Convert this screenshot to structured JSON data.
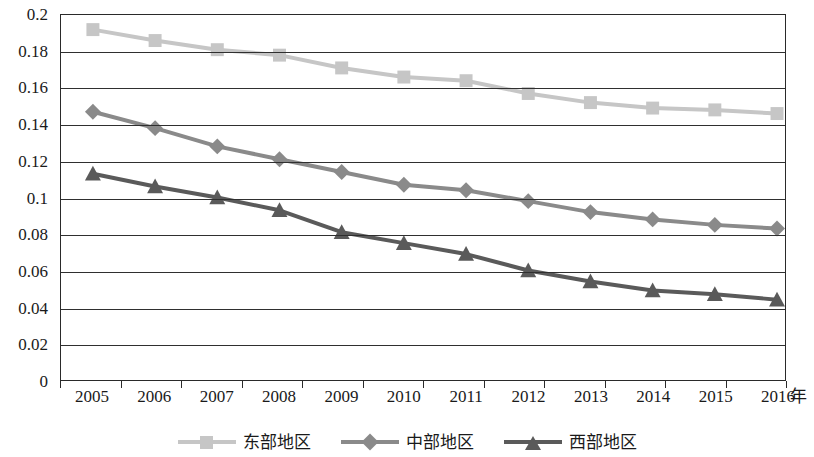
{
  "chart_data": {
    "type": "line",
    "title": "",
    "xlabel": "年",
    "ylabel": "",
    "categories": [
      "2005",
      "2006",
      "2007",
      "2008",
      "2009",
      "2010",
      "2011",
      "2012",
      "2013",
      "2014",
      "2015",
      "2016"
    ],
    "ylim": [
      0,
      0.2
    ],
    "ytick_step": 0.02,
    "yticks": [
      "0.2",
      "0.18",
      "0.16",
      "0.14",
      "0.12",
      "0.1",
      "0.08",
      "0.06",
      "0.04",
      "0.02",
      "0"
    ],
    "ytick_values": [
      0.2,
      0.18,
      0.16,
      0.14,
      0.12,
      0.1,
      0.08,
      0.06,
      0.04,
      0.02,
      0
    ],
    "grid": "horizontal",
    "legend_position": "bottom",
    "series": [
      {
        "name": "东部地区",
        "marker": "square",
        "color": "#c6c6c6",
        "values": [
          0.192,
          0.186,
          0.181,
          0.178,
          0.171,
          0.166,
          0.164,
          0.157,
          0.152,
          0.149,
          0.148,
          0.146
        ]
      },
      {
        "name": "中部地区",
        "marker": "diamond",
        "color": "#8a8a8a",
        "values": [
          0.147,
          0.138,
          0.128,
          0.121,
          0.114,
          0.107,
          0.104,
          0.098,
          0.092,
          0.088,
          0.085,
          0.083
        ]
      },
      {
        "name": "西部地区",
        "marker": "triangle",
        "color": "#5a5a5a",
        "values": [
          0.113,
          0.106,
          0.1,
          0.093,
          0.081,
          0.075,
          0.069,
          0.06,
          0.054,
          0.049,
          0.047,
          0.044
        ]
      }
    ]
  },
  "axis": {
    "unit_label": "年"
  },
  "legend": {
    "items": [
      {
        "label": "东部地区"
      },
      {
        "label": "中部地区"
      },
      {
        "label": "西部地区"
      }
    ]
  }
}
